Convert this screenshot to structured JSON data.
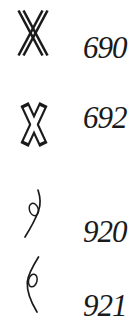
{
  "page": {
    "background": "#ffffff",
    "ink_color": "#1a1a1a"
  },
  "entries": [
    {
      "number": "690",
      "glyph": "double-stroke-x-sign"
    },
    {
      "number": "692",
      "glyph": "outline-x-sign"
    },
    {
      "number": "920",
      "glyph": "right-bulge-curve-loop-sign"
    },
    {
      "number": "921",
      "glyph": "left-bulge-curve-loop-sign"
    }
  ]
}
